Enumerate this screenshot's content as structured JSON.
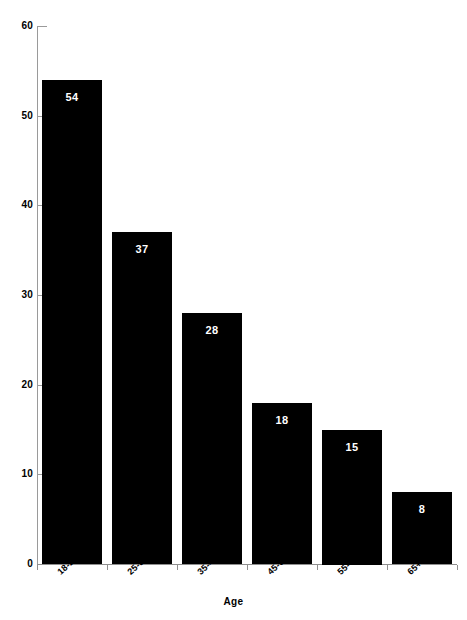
{
  "chart_data": {
    "type": "bar",
    "title": "",
    "xlabel": "Age",
    "ylabel": "",
    "categories": [
      "18-24",
      "25-34",
      "35-44",
      "45-54",
      "55-64",
      "65+"
    ],
    "values": [
      54,
      37,
      28,
      18,
      15,
      8
    ],
    "series": [
      {
        "name": "",
        "values": [
          54,
          37,
          28,
          18,
          15,
          8
        ]
      }
    ],
    "value_labels": [
      "54",
      "37",
      "28",
      "18",
      "15",
      "8"
    ],
    "ylim": [
      0,
      60
    ],
    "y_ticks": [
      0,
      10,
      20,
      30,
      40,
      50,
      60
    ],
    "y_tick_labels": [
      "0",
      "10",
      "20",
      "30",
      "40",
      "50",
      "60"
    ],
    "grid": false,
    "legend": null,
    "legend_position": "none",
    "bar_color": "#000000",
    "value_label_color": "#ffffff",
    "axis_color": "#8f8f8f",
    "background_color": "#ffffff",
    "x_label_rotation_deg": -42
  },
  "axes": {
    "x_title": "Age"
  },
  "artifacts": {
    "top_smudge": "",
    "bottom_smudge": ""
  }
}
